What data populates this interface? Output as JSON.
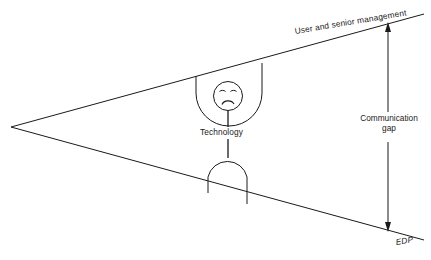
{
  "diagram": {
    "title_alt": "Communication gap wedge diagram",
    "background_color": "#ffffff",
    "line_color": "#1a1a1a",
    "labels": {
      "top_edge": "User and senior management",
      "bottom_edge": "EDP",
      "gap_line1": "Communication",
      "gap_line2": "gap",
      "center_figure": "Technology"
    },
    "geometry": {
      "apex_x": 11,
      "apex_y": 127,
      "top_right_x": 424,
      "top_right_y": 14,
      "bottom_right_x": 424,
      "bottom_right_y": 240,
      "gap_arrow_x": 388,
      "gap_arrow_top_y": 26,
      "gap_arrow_bottom_y": 228
    },
    "icons": {
      "face": "sad-face-icon",
      "upper_shape": "u-cup-shape",
      "lower_shape": "arch-shape",
      "gap_arrow": "double-headed-vertical-arrow"
    }
  }
}
